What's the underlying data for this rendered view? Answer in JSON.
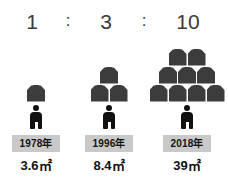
{
  "chart_data": {
    "type": "bar",
    "title": "",
    "subtitle": "",
    "xlabel": "",
    "ylabel": "",
    "categories": [
      "1978年",
      "1996年",
      "2018年"
    ],
    "values": [
      3.6,
      8.4,
      39
    ],
    "value_labels": [
      "3.6㎡",
      "8.4㎡",
      "39㎡"
    ],
    "unit": "㎡",
    "ratio_labels": [
      "1",
      "3",
      "10"
    ],
    "icon_counts": [
      1,
      3,
      9
    ],
    "legend": [],
    "grid": false,
    "annotations": [
      "1 : 3 : 10"
    ]
  },
  "ratio": {
    "first": "1",
    "separator_1": ":",
    "second": "3",
    "separator_2": ":",
    "third": "10"
  },
  "columns": [
    {
      "ratio": "1",
      "year": "1978年",
      "value": "3.6㎡",
      "house_count": 1,
      "house_rows": [
        1
      ],
      "person_icon": "person-icon",
      "house_icon": "house-icon"
    },
    {
      "ratio": "3",
      "year": "1996年",
      "value": "8.4㎡",
      "house_count": 3,
      "house_rows": [
        1,
        2
      ],
      "person_icon": "person-icon",
      "house_icon": "house-icon"
    },
    {
      "ratio": "10",
      "year": "2018年",
      "value": "39㎡",
      "house_count": 9,
      "house_rows": [
        2,
        3,
        4
      ],
      "person_icon": "person-icon",
      "house_icon": "house-icon"
    }
  ],
  "colors": {
    "background": "#ffffff",
    "house_fill": "#3c3c3c",
    "person_fill": "#111111",
    "badge_background": "#c9c9c9",
    "badge_text": "#141414",
    "ratio_text": "#3a3a3a",
    "value_text": "#111111"
  }
}
